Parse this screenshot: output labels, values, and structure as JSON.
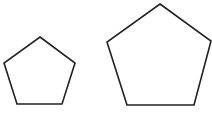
{
  "diagram": {
    "background": "#ffffff",
    "stroke_color": "#222222",
    "stroke_width": 1.6,
    "shapes": [
      {
        "name": "small-pentagon",
        "type": "regular-pentagon",
        "points": "40,37 75,63 62,104 17,104 4,63"
      },
      {
        "name": "large-pentagon",
        "type": "regular-pentagon",
        "points": "160,4 211,41 194,105 127,105 107,42"
      }
    ]
  }
}
